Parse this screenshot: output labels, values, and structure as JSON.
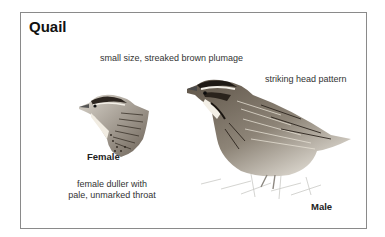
{
  "title": "Quail",
  "annotations": {
    "general": "small size, streaked brown plumage",
    "male_head": "striking head pattern",
    "female_line1": "female duller with",
    "female_line2": "pale, unmarked throat"
  },
  "labels": {
    "female": "Female",
    "male": "Male"
  },
  "colors": {
    "border": "#8a8a8a",
    "text": "#1a1a1a"
  }
}
